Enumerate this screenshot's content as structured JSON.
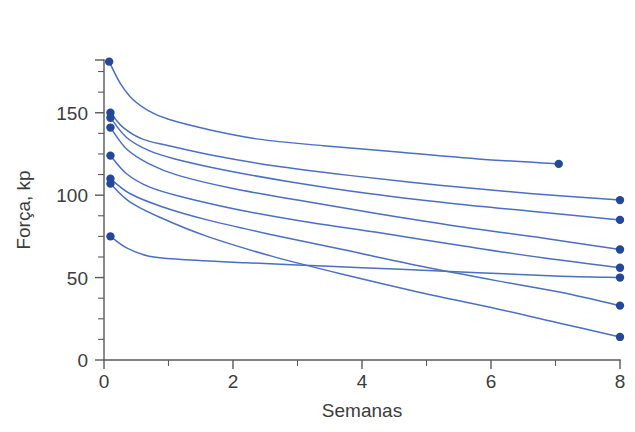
{
  "chart_data": {
    "type": "line",
    "title": "",
    "xlabel": "Semanas",
    "ylabel": "Força, kp",
    "xlim": [
      0,
      8
    ],
    "ylim": [
      0,
      182
    ],
    "grid": false,
    "legend": "none",
    "x_ticks_major": [
      0,
      2,
      4,
      6,
      8
    ],
    "x_ticks_minor": [
      1,
      3,
      5,
      7
    ],
    "x_tick_labels": [
      "0",
      "2",
      "4",
      "6",
      "8"
    ],
    "y_ticks_major": [
      0,
      50,
      100,
      150
    ],
    "y_ticks_minor": [
      12.5,
      25,
      37.5,
      62.5,
      75,
      87.5,
      112.5,
      125,
      137.5,
      162.5,
      175
    ],
    "y_tick_labels": [
      "0",
      "50",
      "100",
      "150"
    ],
    "line_color": "#4a6fc4",
    "marker_color": "#23489b",
    "axis_color": "#5a5a5a",
    "text_color": "#3c3c3c",
    "background": "#ffffff",
    "series": [
      {
        "name": "subject-1",
        "start": {
          "x": 0.08,
          "y": 181
        },
        "end": {
          "x": 7.05,
          "y": 119
        },
        "points": [
          {
            "x": 0.08,
            "y": 181
          },
          {
            "x": 0.25,
            "y": 168
          },
          {
            "x": 0.45,
            "y": 158
          },
          {
            "x": 0.7,
            "y": 151
          },
          {
            "x": 1.0,
            "y": 146
          },
          {
            "x": 1.6,
            "y": 140
          },
          {
            "x": 2.4,
            "y": 134
          },
          {
            "x": 3.4,
            "y": 130
          },
          {
            "x": 4.6,
            "y": 126
          },
          {
            "x": 5.8,
            "y": 122
          },
          {
            "x": 7.05,
            "y": 119
          }
        ]
      },
      {
        "name": "subject-2",
        "start": {
          "x": 0.1,
          "y": 150
        },
        "end": {
          "x": 8.0,
          "y": 97
        },
        "points": [
          {
            "x": 0.1,
            "y": 150
          },
          {
            "x": 0.3,
            "y": 141
          },
          {
            "x": 0.6,
            "y": 134
          },
          {
            "x": 1.0,
            "y": 130
          },
          {
            "x": 1.7,
            "y": 124
          },
          {
            "x": 2.6,
            "y": 118
          },
          {
            "x": 3.8,
            "y": 112
          },
          {
            "x": 5.2,
            "y": 106
          },
          {
            "x": 6.6,
            "y": 101
          },
          {
            "x": 8.0,
            "y": 97
          }
        ]
      },
      {
        "name": "subject-3",
        "start": {
          "x": 0.1,
          "y": 147
        },
        "end": {
          "x": 8.0,
          "y": 85
        },
        "points": [
          {
            "x": 0.1,
            "y": 147
          },
          {
            "x": 0.35,
            "y": 135
          },
          {
            "x": 0.7,
            "y": 127
          },
          {
            "x": 1.1,
            "y": 122
          },
          {
            "x": 1.9,
            "y": 115
          },
          {
            "x": 2.9,
            "y": 108
          },
          {
            "x": 4.1,
            "y": 101
          },
          {
            "x": 5.4,
            "y": 95
          },
          {
            "x": 6.7,
            "y": 90
          },
          {
            "x": 8.0,
            "y": 85
          }
        ]
      },
      {
        "name": "subject-4",
        "start": {
          "x": 0.1,
          "y": 141
        },
        "end": {
          "x": 8.0,
          "y": 67
        },
        "points": [
          {
            "x": 0.1,
            "y": 141
          },
          {
            "x": 0.35,
            "y": 128
          },
          {
            "x": 0.7,
            "y": 119
          },
          {
            "x": 1.15,
            "y": 112
          },
          {
            "x": 2.0,
            "y": 104
          },
          {
            "x": 3.0,
            "y": 97
          },
          {
            "x": 4.2,
            "y": 89
          },
          {
            "x": 5.5,
            "y": 81
          },
          {
            "x": 6.8,
            "y": 74
          },
          {
            "x": 8.0,
            "y": 67
          }
        ]
      },
      {
        "name": "subject-5",
        "start": {
          "x": 0.1,
          "y": 124
        },
        "end": {
          "x": 8.0,
          "y": 56
        },
        "points": [
          {
            "x": 0.1,
            "y": 124
          },
          {
            "x": 0.35,
            "y": 113
          },
          {
            "x": 0.7,
            "y": 105
          },
          {
            "x": 1.2,
            "y": 99
          },
          {
            "x": 2.1,
            "y": 91
          },
          {
            "x": 3.1,
            "y": 84
          },
          {
            "x": 4.3,
            "y": 77
          },
          {
            "x": 5.6,
            "y": 69
          },
          {
            "x": 6.8,
            "y": 62
          },
          {
            "x": 8.0,
            "y": 56
          }
        ]
      },
      {
        "name": "subject-6",
        "start": {
          "x": 0.1,
          "y": 110
        },
        "end": {
          "x": 8.0,
          "y": 33
        },
        "points": [
          {
            "x": 0.1,
            "y": 110
          },
          {
            "x": 0.4,
            "y": 101
          },
          {
            "x": 0.9,
            "y": 93
          },
          {
            "x": 1.6,
            "y": 85
          },
          {
            "x": 2.6,
            "y": 76
          },
          {
            "x": 3.7,
            "y": 67
          },
          {
            "x": 4.9,
            "y": 57
          },
          {
            "x": 6.1,
            "y": 48
          },
          {
            "x": 7.1,
            "y": 41
          },
          {
            "x": 8.0,
            "y": 33
          }
        ]
      },
      {
        "name": "subject-7",
        "start": {
          "x": 0.1,
          "y": 107
        },
        "end": {
          "x": 8.0,
          "y": 14
        },
        "points": [
          {
            "x": 0.1,
            "y": 107
          },
          {
            "x": 0.4,
            "y": 96
          },
          {
            "x": 0.9,
            "y": 86
          },
          {
            "x": 1.6,
            "y": 75
          },
          {
            "x": 2.6,
            "y": 63
          },
          {
            "x": 3.7,
            "y": 52
          },
          {
            "x": 4.9,
            "y": 41
          },
          {
            "x": 6.1,
            "y": 31
          },
          {
            "x": 7.1,
            "y": 22
          },
          {
            "x": 8.0,
            "y": 14
          }
        ]
      },
      {
        "name": "subject-8",
        "start": {
          "x": 0.1,
          "y": 75
        },
        "end": {
          "x": 8.0,
          "y": 50
        },
        "points": [
          {
            "x": 0.1,
            "y": 75
          },
          {
            "x": 0.35,
            "y": 68
          },
          {
            "x": 0.7,
            "y": 63
          },
          {
            "x": 1.2,
            "y": 61
          },
          {
            "x": 2.2,
            "y": 59
          },
          {
            "x": 3.4,
            "y": 57
          },
          {
            "x": 4.6,
            "y": 55
          },
          {
            "x": 5.8,
            "y": 53
          },
          {
            "x": 7.0,
            "y": 51
          },
          {
            "x": 8.0,
            "y": 50
          }
        ]
      }
    ]
  }
}
